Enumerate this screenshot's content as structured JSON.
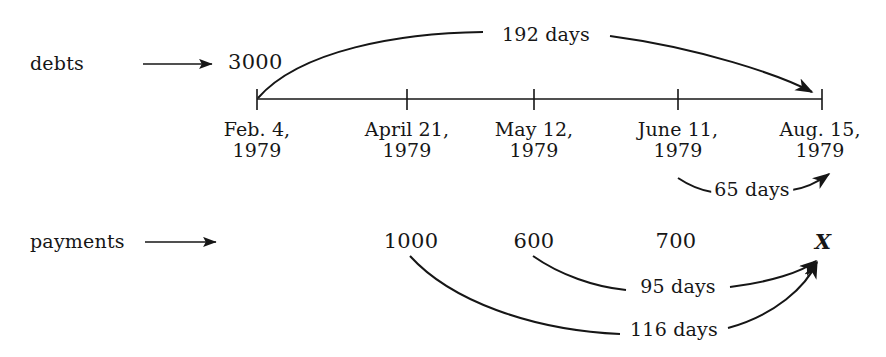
{
  "diagram": {
    "background_color": "#ffffff",
    "ink_color": "#161616",
    "rows": [
      {
        "name": "debts",
        "label": "debts"
      },
      {
        "name": "payments",
        "label": "payments"
      }
    ],
    "debts": {
      "row_label": "debts",
      "amounts": [
        {
          "value": "3000",
          "at_date": "Feb. 4, 1979"
        }
      ],
      "focal_date_marker": "Aug. 15, 1979"
    },
    "payments": {
      "row_label": "payments",
      "amounts": [
        {
          "value": "1000",
          "at_date": "April 21, 1979"
        },
        {
          "value": "600",
          "at_date": "May 12, 1979"
        },
        {
          "value": "700",
          "at_date": "June 11, 1979"
        },
        {
          "value": "X",
          "at_date": "Aug. 15, 1979"
        }
      ]
    },
    "timeline": {
      "axis_start_x": 257,
      "axis_end_x": 822,
      "ticks": [
        {
          "index": 0,
          "x": 257,
          "month_day": "Feb. 4,",
          "year": "1979"
        },
        {
          "index": 1,
          "x": 407,
          "month_day": "April 21,",
          "year": "1979"
        },
        {
          "index": 2,
          "x": 534,
          "month_day": "May 12,",
          "year": "1979"
        },
        {
          "index": 3,
          "x": 678,
          "month_day": "June 11,",
          "year": "1979"
        },
        {
          "index": 4,
          "x": 822,
          "month_day": "Aug. 15,",
          "year": "1979"
        }
      ]
    },
    "intervals": [
      {
        "name": "debt-3000-to-focal",
        "label": "192 days",
        "from": "Feb. 4, 1979",
        "to": "Aug. 15, 1979",
        "days": 192,
        "side": "above"
      },
      {
        "name": "payment-700-to-focal",
        "label": "65 days",
        "from": "June 11, 1979",
        "to": "Aug. 15, 1979",
        "days": 65,
        "side": "below"
      },
      {
        "name": "payment-600-to-focal",
        "label": "95 days",
        "from": "May 12, 1979",
        "to": "Aug. 15, 1979",
        "days": 95,
        "side": "below"
      },
      {
        "name": "payment-1000-to-focal",
        "label": "116 days",
        "from": "April 21, 1979",
        "to": "Aug. 15, 1979",
        "days": 116,
        "side": "below"
      }
    ],
    "pointers": [
      {
        "name": "debts-row-pointer",
        "icon": "right-arrow-icon"
      },
      {
        "name": "payments-row-pointer",
        "icon": "right-arrow-icon"
      }
    ]
  }
}
